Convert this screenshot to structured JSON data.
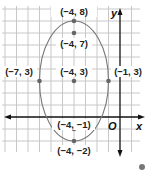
{
  "diagram": {
    "type": "ellipse-on-coordinate-grid",
    "axes": {
      "x_label": "x",
      "y_label": "y",
      "origin_label": "O"
    },
    "points": [
      {
        "label": "(−4, 8)",
        "x": -4,
        "y": 8,
        "role": "vertex-top"
      },
      {
        "label": "(−4, 7)",
        "x": -4,
        "y": 7,
        "role": "focus-top"
      },
      {
        "label": "(−7, 3)",
        "x": -7,
        "y": 3,
        "role": "co-vertex-left"
      },
      {
        "label": "(−4, 3)",
        "x": -4,
        "y": 3,
        "role": "center"
      },
      {
        "label": "(−1, 3)",
        "x": -1,
        "y": 3,
        "role": "co-vertex-right"
      },
      {
        "label": "(−4, −1)",
        "x": -4,
        "y": -1,
        "role": "focus-bottom"
      },
      {
        "label": "(−4, −2)",
        "x": -4,
        "y": -2,
        "role": "vertex-bottom"
      }
    ],
    "ellipse": {
      "center": [
        -4,
        3
      ],
      "semi_major_vertical": 5,
      "semi_minor_horizontal": 3
    },
    "colors": {
      "grid": "#c8c8c8",
      "axes": "#111111",
      "ellipse": "#777777",
      "points": "#666666"
    }
  }
}
